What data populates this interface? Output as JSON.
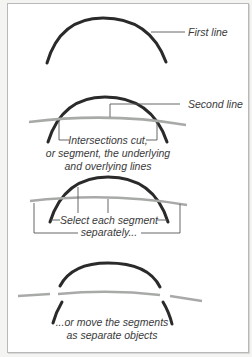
{
  "labels": {
    "first_line": "First line",
    "second_line": "Second line",
    "intersections_1": "Intersections cut,",
    "intersections_2": "or segment, the underlying",
    "intersections_3": "and overlying lines",
    "select_1": "Select each segment",
    "select_2": "separately...",
    "move_1": "...or move the segments",
    "move_2": "as separate objects"
  },
  "colors": {
    "first_line": "#2a2a2a",
    "second_line": "#a8aaa8",
    "leader": "#555555",
    "text": "#3a3a3a"
  }
}
